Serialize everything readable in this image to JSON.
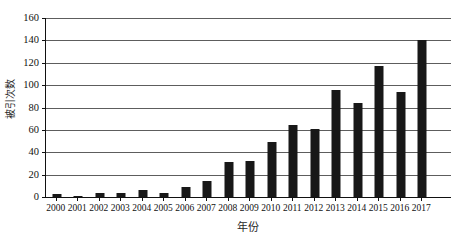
{
  "chart_data": {
    "type": "bar",
    "title": "",
    "xlabel": "年份",
    "ylabel": "被引次数",
    "categories": [
      "2000",
      "2001",
      "2002",
      "2003",
      "2004",
      "2005",
      "2006",
      "2007",
      "2008",
      "2009",
      "2010",
      "2011",
      "2012",
      "2013",
      "2014",
      "2015",
      "2016",
      "2017"
    ],
    "values": [
      3,
      1,
      4,
      4,
      6,
      4,
      9,
      14,
      31,
      32,
      49,
      64,
      61,
      96,
      84,
      117,
      94,
      140
    ],
    "series": [
      {
        "name": "被引次数",
        "values": [
          3,
          1,
          4,
          4,
          6,
          4,
          9,
          14,
          31,
          32,
          49,
          64,
          61,
          96,
          84,
          117,
          94,
          140
        ]
      }
    ],
    "ylim": [
      0,
      160
    ],
    "ytick_step": 20,
    "yticks": [
      0,
      20,
      40,
      60,
      80,
      100,
      120,
      140,
      160
    ],
    "ytick_labels": [
      "0",
      "20",
      "40",
      "60",
      "80",
      "100",
      "120",
      "140",
      "160"
    ],
    "xlim_categories": 18,
    "grid": true,
    "grid_axis": "y",
    "legend": false,
    "legend_position": "none",
    "bar_color": "#181818",
    "gridline_color": "#5d5d5d",
    "axis_color": "#111111",
    "background_color": "#ffffff"
  }
}
